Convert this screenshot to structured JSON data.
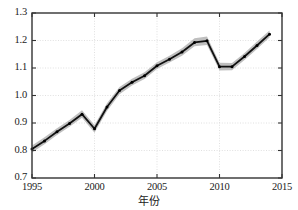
{
  "chart_data": {
    "type": "line",
    "title": "",
    "xlabel": "年份",
    "ylabel": "",
    "xlim": [
      1995,
      2015
    ],
    "ylim": [
      0.7,
      1.3
    ],
    "grid": true,
    "legend": null,
    "xticks": [
      1995,
      2000,
      2005,
      2010,
      2015
    ],
    "xtick_labels": [
      "1995",
      "2000",
      "2005",
      "2010",
      "2015"
    ],
    "yticks": [
      0.7,
      0.8,
      0.9,
      1.0,
      1.1,
      1.2,
      1.3
    ],
    "ytick_labels": [
      "0.7",
      "0.8",
      "0.9",
      "1.0",
      "1.1",
      "1.2",
      "1.3"
    ],
    "x": [
      1995,
      1996,
      1997,
      1998,
      1999,
      2000,
      2001,
      2002,
      2003,
      2004,
      2005,
      2006,
      2007,
      2008,
      2009,
      2010,
      2011,
      2012,
      2013,
      2014
    ],
    "series": [
      {
        "name": "estimate",
        "marker": "dot",
        "color": "#111111",
        "values": [
          0.805,
          0.835,
          0.868,
          0.898,
          0.932,
          0.879,
          0.958,
          1.018,
          1.048,
          1.072,
          1.108,
          1.132,
          1.158,
          1.193,
          1.199,
          1.105,
          1.105,
          1.142,
          1.182,
          1.223
        ]
      }
    ],
    "band": {
      "name": "confidence-interval",
      "color": "#b4b4b4",
      "lower": [
        0.793,
        0.823,
        0.856,
        0.886,
        0.919,
        0.865,
        0.944,
        1.005,
        1.036,
        1.06,
        1.096,
        1.12,
        1.145,
        1.179,
        1.184,
        1.091,
        1.092,
        1.129,
        1.169,
        1.211
      ],
      "upper": [
        0.818,
        0.848,
        0.881,
        0.911,
        0.946,
        0.893,
        0.972,
        1.031,
        1.061,
        1.085,
        1.121,
        1.145,
        1.172,
        1.208,
        1.215,
        1.119,
        1.118,
        1.155,
        1.196,
        1.236
      ]
    }
  },
  "axes": {
    "frame_color": "#333333",
    "grid_color": "#d8d8d8",
    "background": "#ffffff"
  }
}
